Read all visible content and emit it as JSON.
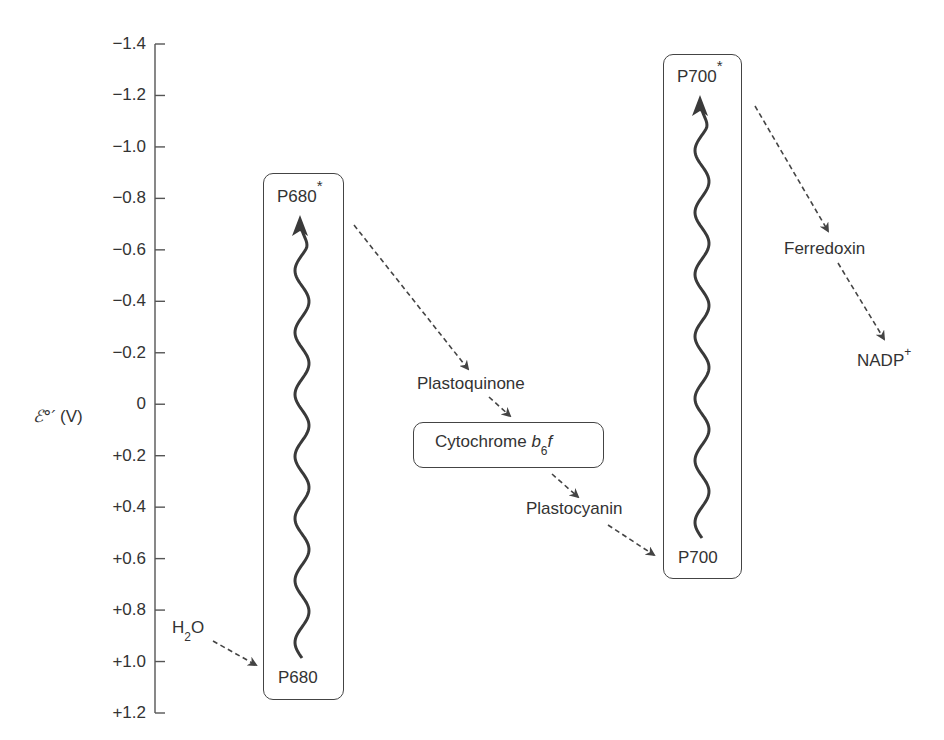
{
  "diagram": {
    "type": "Z-scheme (photosynthetic electron transport)",
    "axis": {
      "label_symbol": "ℰ°′",
      "label_unit": "(V)",
      "ticks": [
        "−1.4",
        "−1.2",
        "−1.0",
        "−0.8",
        "−0.6",
        "−0.4",
        "−0.2",
        "0",
        "+0.2",
        "+0.4",
        "+0.6",
        "+0.8",
        "+1.0",
        "+1.2"
      ],
      "range": [
        -1.4,
        1.2
      ]
    },
    "photosystem_ii": {
      "top_label": "P680",
      "top_sup": "*",
      "bottom_label": "P680"
    },
    "photosystem_i": {
      "top_label": "P700",
      "top_sup": "*",
      "bottom_label": "P700"
    },
    "water": {
      "main": "H",
      "sub": "2",
      "tail": "O"
    },
    "carriers": {
      "plastoquinone": "Plastoquinone",
      "cytochrome": {
        "main": "Cytochrome ",
        "b": "b",
        "sub": "6",
        "f": "f"
      },
      "plastocyanin": "Plastocyanin",
      "ferredoxin": "Ferredoxin",
      "nadp": {
        "main": "NADP",
        "sup": "+"
      }
    },
    "colors": {
      "ink": "#333333",
      "stroke": "#444444",
      "background": "#ffffff"
    }
  }
}
